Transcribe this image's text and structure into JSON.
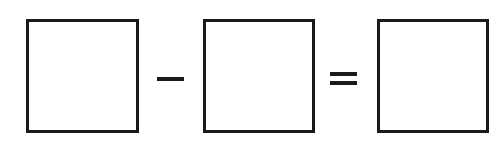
{
  "equation": {
    "operands": [
      {
        "label": "box-1",
        "value": ""
      },
      {
        "label": "box-2",
        "value": ""
      }
    ],
    "operator": "-",
    "equals": "=",
    "result": {
      "label": "box-3",
      "value": ""
    }
  },
  "colors": {
    "stroke": "#1a1a1a",
    "background": "#ffffff"
  }
}
